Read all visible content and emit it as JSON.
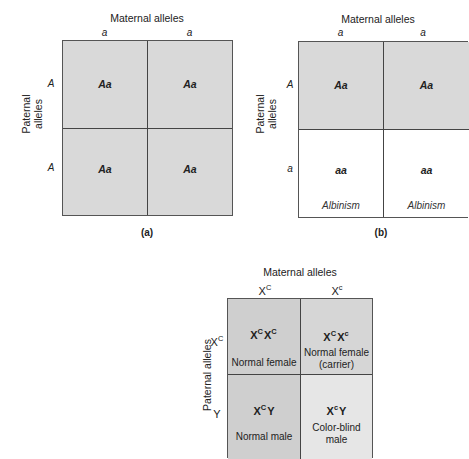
{
  "panels": [
    {
      "id": "a",
      "caption": "(a)",
      "maternal_label": "Maternal alleles",
      "paternal_label_line1": "Paternal",
      "paternal_label_line2": "alleles",
      "maternal_alleles": [
        "a",
        "a"
      ],
      "paternal_alleles": [
        "A",
        "A"
      ],
      "cells": [
        {
          "genotype": "Aa",
          "phenotype": "",
          "fill": "#d9d9d9"
        },
        {
          "genotype": "Aa",
          "phenotype": "",
          "fill": "#d9d9d9"
        },
        {
          "genotype": "Aa",
          "phenotype": "",
          "fill": "#d9d9d9"
        },
        {
          "genotype": "Aa",
          "phenotype": "",
          "fill": "#d9d9d9"
        }
      ]
    },
    {
      "id": "b",
      "caption": "(b)",
      "maternal_label": "Maternal alleles",
      "paternal_label_line1": "Paternal",
      "paternal_label_line2": "alleles",
      "maternal_alleles": [
        "a",
        "a"
      ],
      "paternal_alleles": [
        "A",
        "a"
      ],
      "cells": [
        {
          "genotype": "Aa",
          "phenotype": "",
          "fill": "#d9d9d9"
        },
        {
          "genotype": "Aa",
          "phenotype": "",
          "fill": "#d9d9d9"
        },
        {
          "genotype": "aa",
          "phenotype": "Albinism",
          "fill": "#ffffff"
        },
        {
          "genotype": "aa",
          "phenotype": "Albinism",
          "fill": "#ffffff"
        }
      ]
    },
    {
      "id": "c",
      "maternal_label": "Maternal alleles",
      "paternal_label": "Paternal alleles",
      "maternal_alleles": [
        {
          "base": "X",
          "sup": "C"
        },
        {
          "base": "X",
          "sup": "c"
        }
      ],
      "paternal_alleles": [
        {
          "base": "X",
          "sup": "C"
        },
        {
          "base": "Y",
          "sup": ""
        }
      ],
      "cells": [
        {
          "g1": "X",
          "s1": "C",
          "g2": "X",
          "s2": "C",
          "g2_plain": "",
          "phenotype_line1": "Normal female",
          "phenotype_line2": "",
          "fill": "#cfcfcf"
        },
        {
          "g1": "X",
          "s1": "C",
          "g2": "X",
          "s2": "c",
          "g2_plain": "",
          "phenotype_line1": "Normal female",
          "phenotype_line2": "(carrier)",
          "fill": "#d6d6d6"
        },
        {
          "g1": "X",
          "s1": "C",
          "g2": "",
          "s2": "",
          "g2_plain": "Y",
          "phenotype_line1": "Normal male",
          "phenotype_line2": "",
          "fill": "#cfcfcf"
        },
        {
          "g1": "X",
          "s1": "c",
          "g2": "",
          "s2": "",
          "g2_plain": "Y",
          "phenotype_line1": "Color-blind",
          "phenotype_line2": "male",
          "fill": "#e6e6e6"
        }
      ]
    }
  ]
}
